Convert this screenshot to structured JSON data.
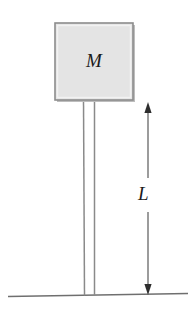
{
  "figure": {
    "kind": "physics-diagram",
    "width": 196,
    "height": 313,
    "background_color": "#ffffff"
  },
  "labels": {
    "mass": "M",
    "length": "L"
  },
  "colors": {
    "box_fill": "#e4e4e4",
    "box_stroke": "#8c8c8c",
    "box_shadow": "#b8b8b8",
    "rod_stroke": "#8a8a8a",
    "ground_stroke": "#6f6f6f",
    "arrow_stroke": "#5a5a5a",
    "text": "#1a1a1a"
  },
  "geometry": {
    "box": {
      "x": 55,
      "y": 23,
      "width": 78,
      "height": 77
    },
    "rod_left": {
      "x1": 83,
      "y1": 100,
      "x2": 84,
      "y2": 295
    },
    "rod_right": {
      "x1": 94,
      "y1": 100,
      "x2": 94,
      "y2": 295
    },
    "ground": {
      "x1": 8,
      "y1": 296,
      "x2": 188,
      "y2": 293
    },
    "dimension_line": {
      "x": 148,
      "y_top": 103,
      "y_bottom": 294
    },
    "dimension_gap": {
      "y_top": 178,
      "y_bottom": 212
    }
  },
  "elements": {
    "mass_box_name": "mass-box",
    "rod_name": "vertical-rod",
    "ground_name": "ground-line",
    "dimension_name": "length-dimension-arrow"
  }
}
